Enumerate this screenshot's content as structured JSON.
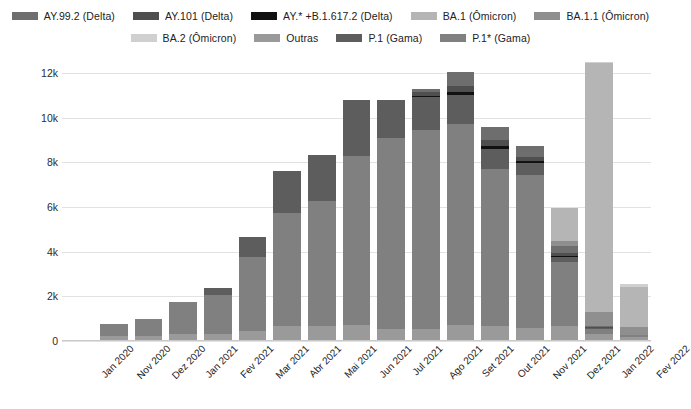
{
  "chart_data": {
    "type": "bar",
    "stacked": true,
    "title": "",
    "subtitle": "",
    "xlabel": "",
    "ylabel": "Genomas depositados",
    "ylim": [
      0,
      12000
    ],
    "yticks": [
      0,
      2000,
      4000,
      6000,
      8000,
      10000,
      12000
    ],
    "ytick_labels": [
      "0",
      "2k",
      "4k",
      "6k",
      "8k",
      "10k",
      "12k"
    ],
    "grid": true,
    "legend_position": "top",
    "categories": [
      "Jan 2020",
      "Nov 2020",
      "Dez 2020",
      "Jan 2021",
      "Fev 2021",
      "Mar 2021",
      "Abr 2021",
      "Mai 2021",
      "Jun 2021",
      "Jul 2021",
      "Ago 2021",
      "Set 2021",
      "Out 2021",
      "Nov 2021",
      "Dez 2021",
      "Jan 2022",
      "Fev 2022"
    ],
    "series": [
      {
        "name": "AY.99.2 (Delta)",
        "color": "#6e6e6e",
        "values": [
          0,
          0,
          0,
          0,
          0,
          0,
          0,
          0,
          0,
          0,
          120,
          620,
          580,
          500,
          330,
          40,
          0
        ]
      },
      {
        "name": "AY.101 (Delta)",
        "color": "#4f4f4f",
        "values": [
          0,
          0,
          0,
          0,
          0,
          0,
          0,
          0,
          0,
          0,
          180,
          300,
          260,
          210,
          120,
          30,
          0
        ]
      },
      {
        "name": "AY.* +B.1.617.2 (Delta)",
        "color": "#111111",
        "values": [
          0,
          0,
          0,
          0,
          0,
          0,
          0,
          0,
          0,
          0,
          60,
          140,
          120,
          90,
          60,
          20,
          0
        ]
      },
      {
        "name": "BA.1 (Ômicron)",
        "color": "#b5b5b5",
        "values": [
          0,
          0,
          0,
          0,
          0,
          0,
          0,
          0,
          0,
          0,
          0,
          0,
          0,
          0,
          1450,
          11150,
          1800
        ]
      },
      {
        "name": "BA.1.1 (Ômicron)",
        "color": "#8f8f8f",
        "values": [
          0,
          0,
          0,
          0,
          0,
          0,
          0,
          0,
          0,
          0,
          0,
          0,
          0,
          0,
          230,
          620,
          340
        ]
      },
      {
        "name": "BA.2 (Ômicron)",
        "color": "#d0d0d0",
        "values": [
          0,
          0,
          0,
          0,
          0,
          0,
          0,
          0,
          0,
          0,
          0,
          0,
          0,
          0,
          0,
          60,
          140
        ]
      },
      {
        "name": "Outras",
        "color": "#9a9a9a",
        "values": [
          30,
          220,
          230,
          330,
          330,
          430,
          680,
          680,
          700,
          560,
          560,
          700,
          660,
          600,
          680,
          300,
          160
        ]
      },
      {
        "name": "P.1 (Gama)",
        "color": "#5d5d5d",
        "values": [
          0,
          0,
          0,
          0,
          340,
          900,
          1900,
          2050,
          2500,
          1700,
          1450,
          1300,
          900,
          520,
          230,
          40,
          0
        ]
      },
      {
        "name": "P.1* (Gama)",
        "color": "#808080",
        "values": [
          0,
          560,
          740,
          1430,
          1720,
          3350,
          5050,
          5580,
          7580,
          8540,
          8900,
          9000,
          7050,
          6830,
          2850,
          240,
          110
        ]
      }
    ],
    "totals": [
      30,
      780,
      970,
      1760,
      2390,
      4680,
      7630,
      8310,
      10780,
      10800,
      11270,
      12060,
      9570,
      8750,
      5950,
      12500,
      2550
    ]
  },
  "legend": {
    "rows": [
      [
        {
          "label": "AY.99.2 (Delta)",
          "color": "#6e6e6e"
        },
        {
          "label": "AY.101 (Delta)",
          "color": "#4f4f4f"
        },
        {
          "label": "AY.* +B.1.617.2 (Delta)",
          "color": "#111111"
        },
        {
          "label": "BA.1 (Ômicron)",
          "color": "#b5b5b5"
        },
        {
          "label": "BA.1.1 (Ômicron)",
          "color": "#8f8f8f"
        }
      ],
      [
        {
          "label": "BA.2 (Ômicron)",
          "color": "#d0d0d0"
        },
        {
          "label": "Outras",
          "color": "#9a9a9a"
        },
        {
          "label": "P.1 (Gama)",
          "color": "#5d5d5d"
        },
        {
          "label": "P.1* (Gama)",
          "color": "#808080"
        }
      ]
    ]
  },
  "axes": {
    "y_title": "Genomas depositados",
    "y_tick_labels": [
      "12k",
      "10k",
      "8k",
      "6k",
      "4k",
      "2k",
      "0"
    ],
    "x_tick_labels": [
      "Jan 2020",
      "Nov 2020",
      "Dez 2020",
      "Jan 2021",
      "Fev 2021",
      "Mar 2021",
      "Abr 2021",
      "Mai 2021",
      "Jun 2021",
      "Jul 2021",
      "Ago 2021",
      "Set 2021",
      "Out 2021",
      "Nov 2021",
      "Dez 2021",
      "Jan 2022",
      "Fev 2022"
    ]
  },
  "colors": {
    "grid": "#e2e2e2",
    "text": "#222222",
    "background": "#ffffff"
  }
}
